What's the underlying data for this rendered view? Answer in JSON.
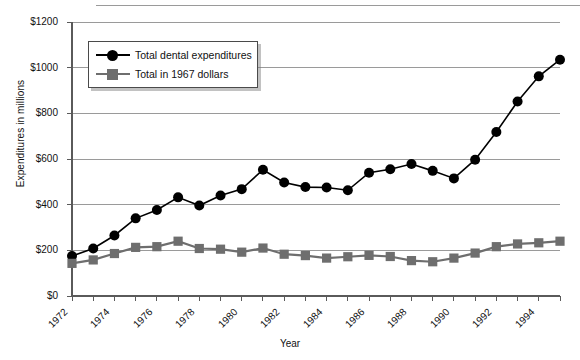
{
  "chart_data": {
    "type": "line",
    "title": "",
    "xlabel": "Year",
    "ylabel": "Expenditures in millions",
    "xlim": [
      1972,
      1995
    ],
    "ylim": [
      0,
      1200
    ],
    "ytick_values": [
      0,
      200,
      400,
      600,
      800,
      1000,
      1200
    ],
    "ytick_labels": [
      "$0",
      "$200",
      "$400",
      "$600",
      "$800",
      "$1000",
      "$1200"
    ],
    "xtick_labels": [
      "1972",
      "1974",
      "1976",
      "1978",
      "1980",
      "1982",
      "1984",
      "1986",
      "1988",
      "1990",
      "1992",
      "1994"
    ],
    "xtick_values": [
      1972,
      1974,
      1976,
      1978,
      1980,
      1982,
      1984,
      1986,
      1988,
      1990,
      1992,
      1994
    ],
    "minor_xticks": [
      1972,
      1973,
      1974,
      1975,
      1976,
      1977,
      1978,
      1979,
      1980,
      1981,
      1982,
      1983,
      1984,
      1985,
      1986,
      1987,
      1988,
      1989,
      1990,
      1991,
      1992,
      1993,
      1994,
      1995
    ],
    "grid": "horizontal",
    "legend_position": "upper-left-inside",
    "x": [
      1972,
      1973,
      1974,
      1975,
      1976,
      1977,
      1978,
      1979,
      1980,
      1981,
      1982,
      1983,
      1984,
      1985,
      1986,
      1987,
      1988,
      1989,
      1990,
      1991,
      1992,
      1993,
      1994,
      1995
    ],
    "series": [
      {
        "name": "Total dental expenditures",
        "color": "#000000",
        "marker": "circle",
        "values": [
          175,
          208,
          265,
          340,
          377,
          432,
          396,
          440,
          468,
          553,
          497,
          477,
          475,
          463,
          540,
          555,
          578,
          548,
          515,
          597,
          718,
          852,
          962,
          1035
        ]
      },
      {
        "name": "Total in 1967 dollars",
        "color": "#6e6e6e",
        "marker": "square",
        "values": [
          143,
          158,
          186,
          213,
          216,
          240,
          208,
          205,
          192,
          210,
          183,
          177,
          166,
          172,
          178,
          173,
          155,
          150,
          166,
          188,
          216,
          228,
          233,
          240
        ]
      }
    ]
  },
  "legend": {
    "items": [
      {
        "label": "Total dental expenditures"
      },
      {
        "label": "Total in 1967 dollars"
      }
    ]
  }
}
